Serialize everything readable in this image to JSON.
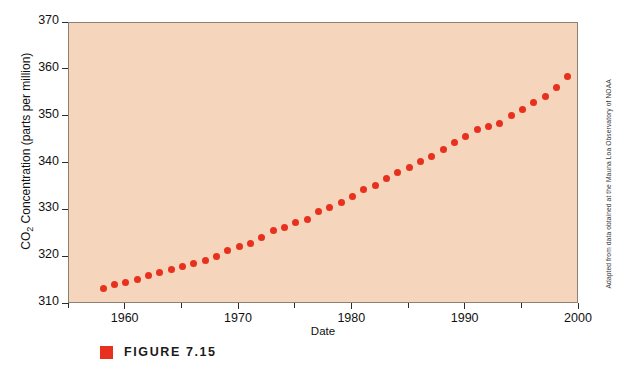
{
  "chart_data": {
    "type": "scatter",
    "title": "",
    "xlabel": "Date",
    "ylabel": "CO2 Concentration (parts per million)",
    "ylabel_prefix": "CO",
    "ylabel_sub": "2",
    "ylabel_suffix": " Concentration (parts per million)",
    "xlim": [
      1955,
      2000
    ],
    "ylim": [
      310,
      370
    ],
    "grid": false,
    "legend": null,
    "marker_color": "#e8301f",
    "plot_background": "#f5d5bb",
    "axis_color": "#2b2b2b",
    "x_major_ticks": [
      1960,
      1970,
      1980,
      1990,
      2000
    ],
    "x_minor_ticks": [
      1955,
      1965,
      1975,
      1985,
      1995
    ],
    "x_tick_labels": [
      "1960",
      "1970",
      "1980",
      "1990",
      "2000"
    ],
    "y_ticks": [
      310,
      320,
      330,
      340,
      350,
      360,
      370
    ],
    "y_tick_labels": [
      "310",
      "320",
      "330",
      "340",
      "350",
      "360",
      "370"
    ],
    "x": [
      1958,
      1959,
      1960,
      1961,
      1962,
      1963,
      1964,
      1965,
      1966,
      1967,
      1968,
      1969,
      1970,
      1971,
      1972,
      1973,
      1974,
      1975,
      1976,
      1977,
      1978,
      1979,
      1980,
      1981,
      1982,
      1983,
      1984,
      1985,
      1986,
      1987,
      1988,
      1989,
      1990,
      1991,
      1992,
      1993,
      1994,
      1995,
      1996,
      1997,
      1998,
      1999
    ],
    "values": [
      313.3,
      314.1,
      314.6,
      315.3,
      316.0,
      316.8,
      317.4,
      318.0,
      318.7,
      319.3,
      320.2,
      321.4,
      322.3,
      323.0,
      324.1,
      325.6,
      326.3,
      327.4,
      328.1,
      329.7,
      330.6,
      331.6,
      333.0,
      334.4,
      335.4,
      336.8,
      338.0,
      339.1,
      340.4,
      341.5,
      343.0,
      344.4,
      345.8,
      347.2,
      348.0,
      348.6,
      350.2,
      351.5,
      353.0,
      354.4,
      356.3,
      358.5
    ],
    "source_note": "Adapted from data obtained at the Mauna Loa Observatory of NOAA"
  },
  "caption": {
    "label": "FIGURE 7.15"
  }
}
